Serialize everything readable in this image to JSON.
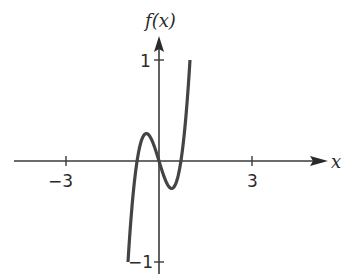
{
  "chart_data": {
    "type": "line",
    "title": "",
    "xlabel": "x",
    "ylabel": "f(x)",
    "xlim": [
      -5,
      5.5
    ],
    "ylim": [
      -1,
      1
    ],
    "x_ticks": [
      -3,
      3
    ],
    "x_tick_labels": [
      "−3",
      "3"
    ],
    "y_ticks": [
      1,
      -1
    ],
    "y_tick_labels": [
      "1",
      "−1"
    ],
    "grid": false,
    "legend": null,
    "series": [
      {
        "name": "f(x)",
        "function": "2x^3 - x",
        "x_domain": [
          -1,
          1
        ],
        "x": [
          -1.0,
          -0.8,
          -0.707,
          -0.6,
          -0.408,
          -0.2,
          0.0,
          0.2,
          0.408,
          0.6,
          0.707,
          0.8,
          1.0
        ],
        "y": [
          -1.0,
          -0.224,
          0.0,
          0.168,
          0.272,
          0.184,
          0.0,
          -0.184,
          -0.272,
          -0.168,
          0.0,
          0.224,
          1.0
        ]
      }
    ],
    "key_points": {
      "local_max": [
        -0.41,
        0.27
      ],
      "local_min": [
        0.41,
        -0.27
      ],
      "roots": [
        -0.71,
        0,
        0.71
      ]
    }
  },
  "labels": {
    "y_axis": "f(x)",
    "x_axis": "x",
    "tick_neg3": "−3",
    "tick_pos3": "3",
    "tick_pos1": "1",
    "tick_neg1": "−1"
  }
}
